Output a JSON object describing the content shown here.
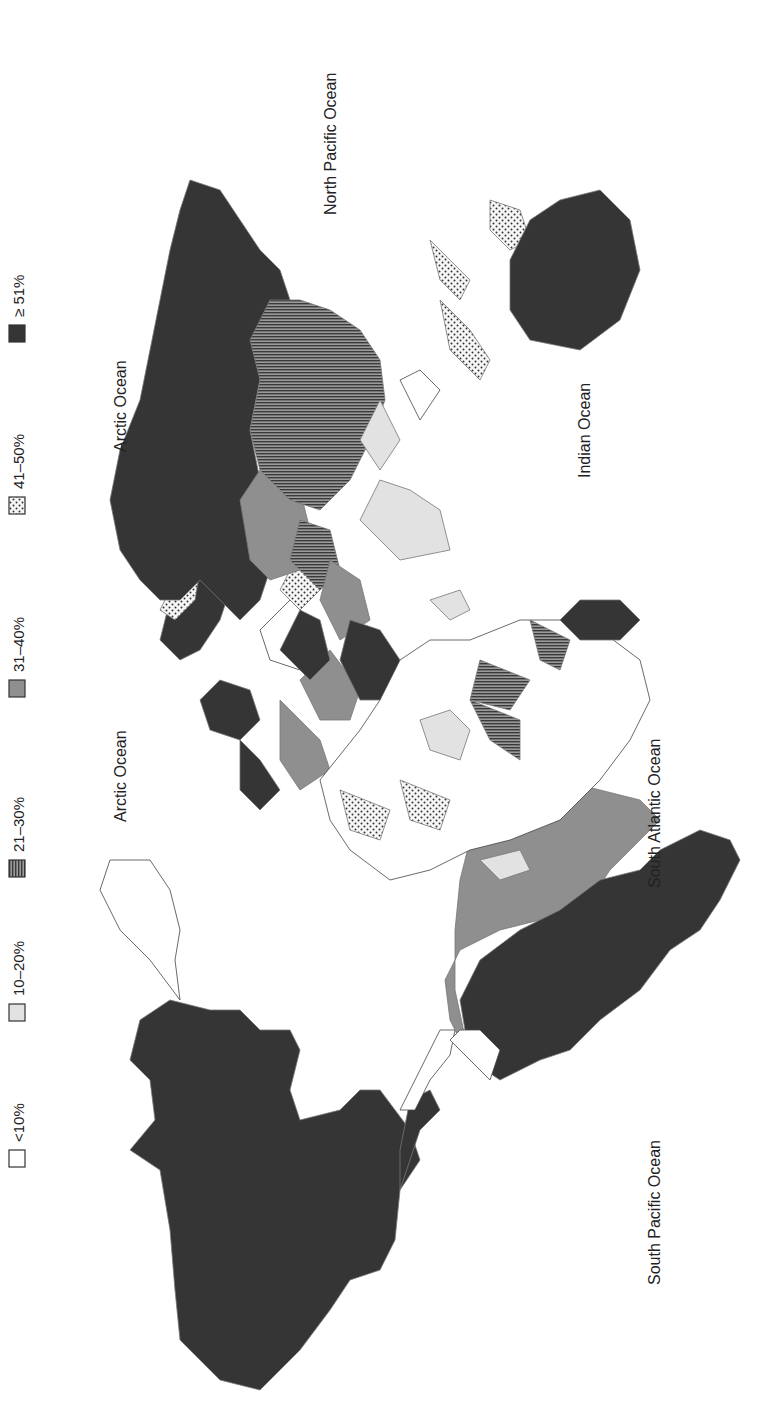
{
  "legend": {
    "orientation": "rotated -90deg (reads bottom-to-top)",
    "items": [
      {
        "label": "<10%",
        "pattern": "white",
        "fill": "#ffffff"
      },
      {
        "label": "10–20%",
        "pattern": "light-gray",
        "fill": "#e2e2e2"
      },
      {
        "label": "21–30%",
        "pattern": "horizontal-lines",
        "fill": "#7a7a7a"
      },
      {
        "label": "31–40%",
        "pattern": "medium-gray",
        "fill": "#8f8f8f"
      },
      {
        "label": "41–50%",
        "pattern": "dots",
        "fill": "#f4f4f4"
      },
      {
        "label": "≥ 51%",
        "pattern": "dark-gray",
        "fill": "#353535"
      }
    ]
  },
  "ocean_labels": [
    {
      "label": "North Pacific Ocean"
    },
    {
      "label": "Arctic Ocean"
    },
    {
      "label": "Arctic Ocean"
    },
    {
      "label": "Indian Ocean"
    },
    {
      "label": "South Atlantic Ocean"
    },
    {
      "label": "South Pacific Ocean"
    }
  ],
  "colors": {
    "dark": "#353535",
    "medium": "#8f8f8f",
    "light": "#e2e2e2",
    "border": "#555555",
    "background": "#ffffff"
  },
  "regions": [
    {
      "name": "North America (USA/Canada)",
      "category": "≥ 51%"
    },
    {
      "name": "Mexico / Central America",
      "category": "≥ 51%"
    },
    {
      "name": "Brazil",
      "category": "31–40%"
    },
    {
      "name": "Western South America",
      "category": "≥ 51%"
    },
    {
      "name": "Argentina/Chile",
      "category": "≥ 51%"
    },
    {
      "name": "Russia",
      "category": "≥ 51%"
    },
    {
      "name": "China",
      "category": "21–30%"
    },
    {
      "name": "Kazakhstan",
      "category": "31–40%"
    },
    {
      "name": "India",
      "category": "10–20%"
    },
    {
      "name": "Australia",
      "category": "≥ 51%"
    },
    {
      "name": "Indonesia",
      "category": "41–50%"
    },
    {
      "name": "Iran",
      "category": "31–40%"
    },
    {
      "name": "Saudi Arabia",
      "category": "≥ 51%"
    },
    {
      "name": "Egypt",
      "category": "≥ 51%"
    },
    {
      "name": "Turkey",
      "category": "≥ 51%"
    },
    {
      "name": "Scandinavia",
      "category": "≥ 51%"
    },
    {
      "name": "Spain",
      "category": "31–40%"
    },
    {
      "name": "UK",
      "category": "≥ 51%"
    },
    {
      "name": "Mauritania",
      "category": "41–50%"
    },
    {
      "name": "DR Congo",
      "category": "21–30%"
    },
    {
      "name": "South Africa",
      "category": "≥ 51%"
    },
    {
      "name": "Most of Africa",
      "category": "<10%"
    }
  ]
}
